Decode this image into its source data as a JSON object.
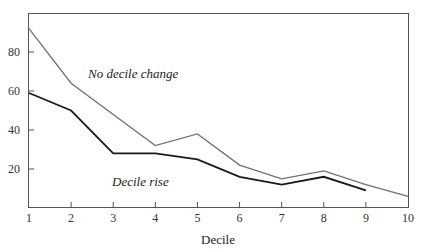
{
  "chart_data": {
    "type": "line",
    "title": "",
    "xlabel": "Decile",
    "ylabel": "",
    "x": [
      1,
      2,
      3,
      4,
      5,
      6,
      7,
      8,
      9,
      10
    ],
    "xticks": [
      "1",
      "2",
      "3",
      "4",
      "5",
      "6",
      "7",
      "8",
      "9",
      "10"
    ],
    "yticks": [
      "20",
      "40",
      "60",
      "80"
    ],
    "ytick_values": [
      20,
      40,
      60,
      80
    ],
    "xlim": [
      1,
      10
    ],
    "ylim": [
      0,
      100
    ],
    "grid": false,
    "legend": "none (inline annotations)",
    "series": [
      {
        "name": "No decile change",
        "color": "#707070",
        "x": [
          1,
          2,
          3,
          4,
          5,
          6,
          7,
          8,
          9,
          10
        ],
        "values": [
          92,
          64,
          48,
          32,
          38,
          22,
          15,
          19,
          12,
          6
        ]
      },
      {
        "name": "Decile rise",
        "color": "#1a1a1a",
        "x": [
          1,
          2,
          3,
          4,
          5,
          6,
          7,
          8,
          9
        ],
        "values": [
          59,
          50,
          28,
          28,
          25,
          16,
          12,
          16,
          9
        ]
      }
    ],
    "annotations": [
      {
        "text": "No decile change",
        "x": 2.1,
        "y": 68
      },
      {
        "text": "Decile rise",
        "x": 3.0,
        "y": 22
      }
    ]
  },
  "labels": {
    "xlabel": "Decile",
    "annot_no_change": "No decile change",
    "annot_rise": "Decile rise"
  }
}
